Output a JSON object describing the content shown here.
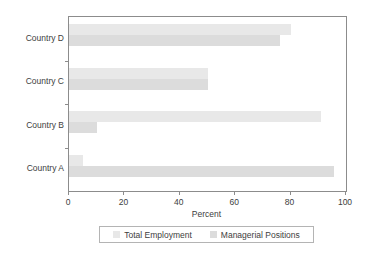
{
  "chart_data": {
    "type": "bar",
    "orientation": "horizontal",
    "title": "",
    "subtitle": "",
    "xlabel": "Percent",
    "ylabel": "",
    "xlim": [
      0,
      100
    ],
    "xticks": [
      0,
      20,
      40,
      60,
      80,
      100
    ],
    "xtick_labels": [
      "0",
      "20",
      "40",
      "60",
      "80",
      "100"
    ],
    "grid": false,
    "legend_position": "bottom",
    "categories": [
      "Country D",
      "Country C",
      "Country B",
      "Country A"
    ],
    "series": [
      {
        "name": "Total Employment",
        "color": "#e8e8e8",
        "values": [
          80,
          50,
          91,
          5
        ]
      },
      {
        "name": "Managerial Positions",
        "color": "#dcdcdc",
        "values": [
          76,
          50,
          10,
          95.5
        ]
      }
    ],
    "axis_color": "#8c8c8c",
    "text_color": "#3d3d3d",
    "background": "#ffffff"
  },
  "legend": {
    "entries": [
      {
        "label": "Total Employment"
      },
      {
        "label": "Managerial Positions"
      }
    ]
  },
  "axis": {
    "x_title": "Percent"
  }
}
